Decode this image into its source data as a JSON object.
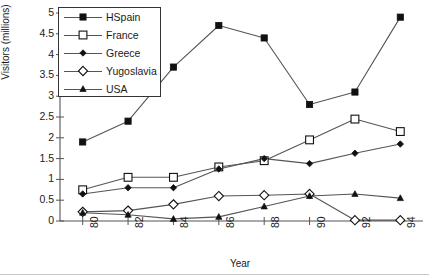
{
  "chart_data": {
    "type": "line",
    "title": "",
    "xlabel": "Year",
    "ylabel": "Visitors (millions)",
    "categories": [
      "80",
      "82",
      "84",
      "86",
      "88",
      "90",
      "92",
      "94"
    ],
    "x": [
      80,
      82,
      84,
      86,
      88,
      90,
      92,
      94
    ],
    "xlim": [
      79,
      95
    ],
    "ylim": [
      0,
      5
    ],
    "yticks": [
      "0",
      "0.5",
      "1",
      "1.5",
      "2",
      "2.5",
      "3",
      "3.5",
      "4",
      "4.5",
      "5"
    ],
    "ytick_values": [
      0,
      0.5,
      1,
      1.5,
      2,
      2.5,
      3,
      3.5,
      4,
      4.5,
      5
    ],
    "grid": false,
    "legend_position": "upper-left-inside",
    "series": [
      {
        "name": "HSpain",
        "marker": "filled-square",
        "values": [
          1.9,
          2.4,
          3.7,
          4.7,
          4.4,
          2.8,
          3.1,
          4.9
        ]
      },
      {
        "name": "France",
        "marker": "open-square",
        "values": [
          0.75,
          1.05,
          1.05,
          1.3,
          1.45,
          1.95,
          2.45,
          2.15
        ]
      },
      {
        "name": "Greece",
        "marker": "filled-diamond",
        "values": [
          0.65,
          0.8,
          0.8,
          1.25,
          1.5,
          1.38,
          1.63,
          1.85
        ]
      },
      {
        "name": "Yugoslavia",
        "marker": "open-diamond",
        "values": [
          0.22,
          0.25,
          0.4,
          0.6,
          0.62,
          0.65,
          0.02,
          0.02
        ]
      },
      {
        "name": "USA",
        "marker": "filled-triangle",
        "values": [
          0.2,
          0.15,
          0.05,
          0.1,
          0.35,
          0.6,
          0.65,
          0.55
        ]
      }
    ],
    "colors": {
      "line": "#555555",
      "marker": "#111111",
      "axis": "#555555",
      "background": "#ffffff"
    }
  }
}
